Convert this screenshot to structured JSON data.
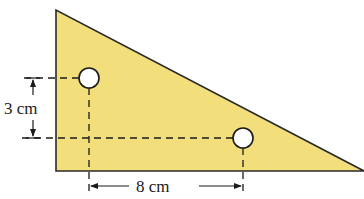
{
  "diagram": {
    "type": "right-triangle-plate-with-two-holes",
    "colors": {
      "fill": "#f2de7a",
      "stroke": "#2a2a2a",
      "hole_fill": "#ffffff",
      "background": "#ffffff"
    },
    "triangle": {
      "vertices": [
        [
          56,
          10
        ],
        [
          56,
          171
        ],
        [
          364,
          171
        ]
      ]
    },
    "holes": [
      {
        "cx": 89,
        "cy": 78,
        "r": 10
      },
      {
        "cx": 243,
        "cy": 138,
        "r": 10
      }
    ],
    "dimensions": {
      "vertical": {
        "label": "3 cm",
        "value": 3,
        "unit": "cm"
      },
      "horizontal": {
        "label": "8 cm",
        "value": 8,
        "unit": "cm"
      }
    }
  }
}
